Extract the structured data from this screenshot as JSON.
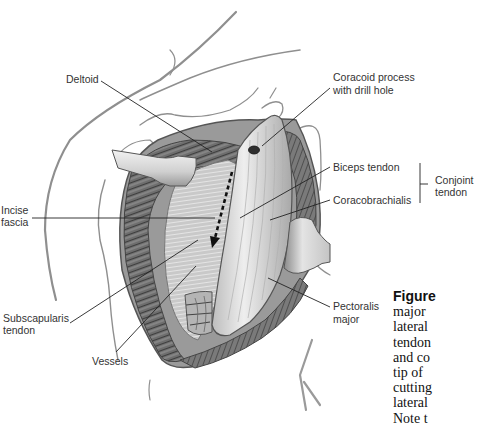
{
  "figure": {
    "type": "surgical illustration",
    "colors": {
      "background": "#ffffff",
      "label_text": "#333333",
      "leader_line": "#222222",
      "skin_outline": "#8a8a8a",
      "muscle_dark": "#555555",
      "muscle_mid": "#9a9a9a",
      "tendon_light": "#e6e6e6",
      "retractor": "#d8d8d8"
    }
  },
  "labels": {
    "deltoid": "Deltoid",
    "coracoid_line1": "Coracoid process",
    "coracoid_line2": "with drill hole",
    "biceps": "Biceps tendon",
    "coracobrachialis": "Coracobrachialis",
    "conjoint_line1": "Conjoint",
    "conjoint_line2": "tendon",
    "incise_line1": "Incise",
    "incise_line2": "fascia",
    "subscap_line1": "Subscapularis",
    "subscap_line2": "tendon",
    "vessels": "Vessels",
    "pectoralis_line1": "Pectoralis",
    "pectoralis_line2": "major"
  },
  "caption": {
    "figure_word": "Figure",
    "lines": [
      "major",
      "lateral",
      "tendon",
      "and co",
      "tip of",
      "cutting",
      "lateral",
      "Note t"
    ]
  }
}
